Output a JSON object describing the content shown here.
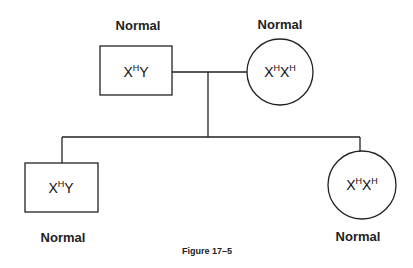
{
  "figure": {
    "caption": "Figure 17–5",
    "type": "pedigree",
    "parents": {
      "father": {
        "label": "Normal",
        "genotype_base1": "X",
        "genotype_sup1": "H",
        "genotype_base2": "Y",
        "genotype_sup2": "",
        "shape": "square"
      },
      "mother": {
        "label": "Normal",
        "genotype_base1": "X",
        "genotype_sup1": "H",
        "genotype_base2": "X",
        "genotype_sup2": "H",
        "shape": "circle"
      }
    },
    "children": [
      {
        "label": "Normal",
        "genotype_base1": "X",
        "genotype_sup1": "H",
        "genotype_base2": "Y",
        "genotype_sup2": "",
        "shape": "square"
      },
      {
        "label": "Normal",
        "genotype_base1": "X",
        "genotype_sup1": "H",
        "genotype_base2": "X",
        "genotype_sup2": "H",
        "shape": "circle"
      }
    ],
    "colors": {
      "stroke": "#222222",
      "background": "#ffffff"
    }
  }
}
